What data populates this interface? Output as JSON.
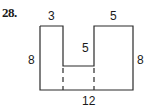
{
  "problem": {
    "number": "28."
  },
  "figure": {
    "labels": {
      "top_left_width": "3",
      "top_right_width": "5",
      "notch_depth": "5",
      "left_height": "8",
      "right_height": "8",
      "bottom_width": "12"
    },
    "stroke_color": "#2a2a2a"
  }
}
